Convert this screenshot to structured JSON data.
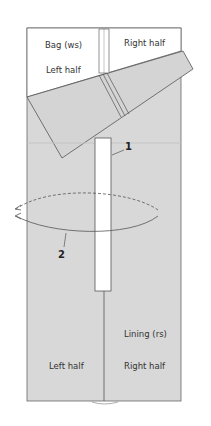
{
  "diagram": {
    "labels": {
      "bag": "Bag (ws)",
      "bag_left": "Left half",
      "bag_right": "Right half",
      "lining": "Lining (rs)",
      "lining_left": "Left half",
      "lining_right": "Right half"
    },
    "callouts": {
      "one": "1",
      "two": "2"
    },
    "colors": {
      "fabric_gray": "#d8d8d8",
      "outline": "#555555",
      "background": "#ffffff",
      "opening": "#ffffff"
    }
  }
}
